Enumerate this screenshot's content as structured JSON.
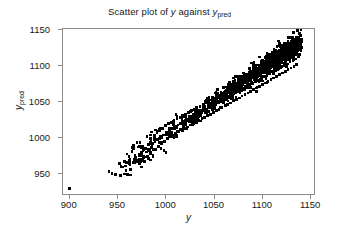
{
  "chart_data": {
    "type": "scatter",
    "title_parts": {
      "prefix": "Scatter plot of ",
      "var1": "y",
      "middle": " against ",
      "var2": "y",
      "var2_sub": "pred"
    },
    "xlabel": "y",
    "ylabel": "y",
    "ylabel_sub": "pred",
    "xlim": [
      893,
      1155
    ],
    "ylim": [
      920,
      1152
    ],
    "xticks": [
      900,
      950,
      1000,
      1050,
      1100,
      1150
    ],
    "yticks": [
      950,
      1000,
      1050,
      1100,
      1150
    ],
    "xtick_labels": [
      "900",
      "950",
      "1000",
      "1050",
      "1100",
      "1150"
    ],
    "ytick_labels": [
      "950",
      "1000",
      "1050",
      "1100",
      "1150"
    ],
    "grid": false,
    "legend": null,
    "marker": {
      "shape": "dot",
      "color": "#000000",
      "size": 1.35
    },
    "n_points": 1080,
    "points": [
      [
        900,
        928
      ],
      [
        941,
        952
      ],
      [
        944,
        949
      ],
      [
        948,
        947
      ],
      [
        952,
        963
      ],
      [
        957,
        948
      ],
      [
        960,
        947
      ],
      [
        963,
        969
      ],
      [
        966,
        964
      ],
      [
        967,
        985
      ],
      [
        969,
        972
      ],
      [
        971,
        968
      ],
      [
        972,
        986
      ],
      [
        973,
        962
      ],
      [
        974,
        976
      ],
      [
        975,
        958
      ],
      [
        976,
        987
      ],
      [
        977,
        971
      ],
      [
        978,
        966
      ],
      [
        979,
        984
      ],
      [
        980,
        979
      ],
      [
        981,
        973
      ],
      [
        982,
        990
      ],
      [
        983,
        981
      ],
      [
        984,
        968
      ],
      [
        985,
        996
      ],
      [
        986,
        988
      ],
      [
        987,
        975
      ],
      [
        988,
        1002
      ],
      [
        989,
        993
      ],
      [
        990,
        983
      ],
      [
        991,
        1006
      ],
      [
        992,
        997
      ],
      [
        993,
        987
      ],
      [
        994,
        1009
      ],
      [
        995,
        1001
      ],
      [
        996,
        991
      ],
      [
        997,
        1012
      ],
      [
        998,
        1003
      ],
      [
        999,
        994
      ],
      [
        1000,
        1016
      ],
      [
        1001,
        1007
      ],
      [
        1002,
        998
      ],
      [
        1003,
        1019
      ],
      [
        1004,
        1010
      ],
      [
        1005,
        1000
      ],
      [
        1006,
        1021
      ],
      [
        1007,
        1012
      ],
      [
        1008,
        1003
      ],
      [
        1009,
        1024
      ],
      [
        1010,
        1014
      ],
      [
        1011,
        1005
      ],
      [
        1012,
        1026
      ],
      [
        1013,
        1017
      ],
      [
        1014,
        1008
      ],
      [
        1015,
        1028
      ],
      [
        1016,
        1019
      ],
      [
        1017,
        1010
      ],
      [
        1018,
        1030
      ],
      [
        1019,
        1021
      ],
      [
        1020,
        1012
      ],
      [
        1021,
        1032
      ],
      [
        1022,
        1023
      ],
      [
        1023,
        1014
      ],
      [
        1024,
        1035
      ],
      [
        1025,
        1026
      ],
      [
        1026,
        1017
      ],
      [
        1027,
        1037
      ],
      [
        1028,
        1028
      ],
      [
        1029,
        1019
      ],
      [
        1030,
        1039
      ],
      [
        1031,
        1030
      ],
      [
        1032,
        1021
      ],
      [
        1033,
        1041
      ],
      [
        1034,
        1032
      ],
      [
        1035,
        1023
      ],
      [
        1036,
        1043
      ],
      [
        1037,
        1034
      ],
      [
        1038,
        1026
      ],
      [
        1039,
        1046
      ],
      [
        1040,
        1037
      ],
      [
        1041,
        1028
      ],
      [
        1042,
        1048
      ],
      [
        1043,
        1039
      ],
      [
        1044,
        1030
      ],
      [
        1045,
        1050
      ],
      [
        1046,
        1041
      ],
      [
        1047,
        1032
      ],
      [
        1048,
        1052
      ],
      [
        1049,
        1043
      ],
      [
        1050,
        1035
      ],
      [
        1051,
        1055
      ],
      [
        1052,
        1046
      ],
      [
        1053,
        1037
      ],
      [
        1054,
        1057
      ],
      [
        1055,
        1048
      ],
      [
        1056,
        1039
      ],
      [
        1057,
        1059
      ],
      [
        1058,
        1050
      ],
      [
        1059,
        1041
      ],
      [
        1060,
        1061
      ],
      [
        1061,
        1052
      ],
      [
        1062,
        1044
      ],
      [
        1063,
        1064
      ],
      [
        1064,
        1055
      ],
      [
        1065,
        1046
      ],
      [
        1066,
        1066
      ],
      [
        1067,
        1057
      ],
      [
        1068,
        1048
      ],
      [
        1069,
        1068
      ],
      [
        1070,
        1059
      ],
      [
        1071,
        1051
      ],
      [
        1072,
        1071
      ],
      [
        1073,
        1062
      ],
      [
        1074,
        1053
      ],
      [
        1075,
        1073
      ],
      [
        1076,
        1064
      ],
      [
        1077,
        1055
      ],
      [
        1078,
        1075
      ],
      [
        1079,
        1066
      ],
      [
        1080,
        1058
      ],
      [
        1081,
        1077
      ],
      [
        1082,
        1068
      ],
      [
        1083,
        1060
      ],
      [
        1084,
        1080
      ],
      [
        1085,
        1071
      ],
      [
        1086,
        1062
      ],
      [
        1087,
        1082
      ],
      [
        1088,
        1073
      ],
      [
        1089,
        1064
      ],
      [
        1090,
        1084
      ],
      [
        1091,
        1075
      ],
      [
        1092,
        1067
      ],
      [
        1093,
        1087
      ],
      [
        1094,
        1078
      ],
      [
        1095,
        1069
      ],
      [
        1096,
        1089
      ],
      [
        1097,
        1080
      ],
      [
        1098,
        1071
      ],
      [
        1099,
        1091
      ],
      [
        1100,
        1082
      ],
      [
        1101,
        1074
      ],
      [
        1102,
        1094
      ],
      [
        1103,
        1085
      ],
      [
        1104,
        1076
      ],
      [
        1105,
        1096
      ],
      [
        1106,
        1087
      ],
      [
        1107,
        1078
      ],
      [
        1108,
        1098
      ],
      [
        1109,
        1089
      ],
      [
        1110,
        1081
      ],
      [
        1111,
        1101
      ],
      [
        1112,
        1092
      ],
      [
        1113,
        1083
      ],
      [
        1114,
        1103
      ],
      [
        1115,
        1094
      ],
      [
        1116,
        1085
      ],
      [
        1117,
        1105
      ],
      [
        1118,
        1096
      ],
      [
        1119,
        1088
      ],
      [
        1120,
        1108
      ],
      [
        1121,
        1099
      ],
      [
        1122,
        1090
      ],
      [
        1123,
        1110
      ],
      [
        1124,
        1101
      ],
      [
        1125,
        1092
      ],
      [
        1126,
        1112
      ],
      [
        1127,
        1103
      ],
      [
        1128,
        1095
      ],
      [
        1129,
        1115
      ],
      [
        1130,
        1106
      ],
      [
        1131,
        1097
      ],
      [
        1132,
        1117
      ],
      [
        1133,
        1108
      ],
      [
        1134,
        1099
      ],
      [
        1135,
        1119
      ],
      [
        1136,
        1110
      ],
      [
        1137,
        1102
      ],
      [
        1138,
        1122
      ],
      [
        1139,
        1113
      ],
      [
        1140,
        1131
      ],
      [
        1141,
        1135
      ]
    ],
    "density_model": {
      "note": "Remaining points generated along band y_pred = 0.93*y + 72 with x-dependent spread and x-dependent density weighting matching the figure.",
      "slope": 0.93,
      "intercept": 72,
      "x_range": [
        985,
        1142
      ],
      "spread_at_xmin": 9,
      "spread_at_xmax": 15,
      "density_exponent": 2.6,
      "seed": 20240517,
      "generated_count": 900
    }
  }
}
